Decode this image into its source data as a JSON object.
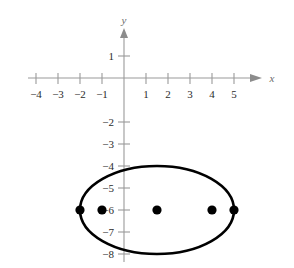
{
  "figure": {
    "title": "",
    "background_color": "#ffffff",
    "axis_color": "#8c8c8c",
    "curve_color": "#000000",
    "point_color": "#000000",
    "x_axis_label": "x",
    "y_axis_label": "y"
  },
  "chart_data": {
    "type": "scatter",
    "title": "",
    "xlabel": "x",
    "ylabel": "y",
    "grid": false,
    "legend": null,
    "xlim": [
      -4.6,
      5.8
    ],
    "ylim": [
      -8.6,
      1.8
    ],
    "x_ticks": [
      -4,
      -3,
      -2,
      -1,
      1,
      2,
      3,
      4,
      5
    ],
    "x_tick_labels": [
      "−4",
      "−3",
      "−2",
      "−1",
      "1",
      "2",
      "3",
      "4",
      "5"
    ],
    "y_ticks": [
      1,
      -2,
      -3,
      -4,
      -5,
      -6,
      -7,
      -8
    ],
    "y_tick_labels": [
      "1",
      "−2",
      "−3",
      "−4",
      "−5",
      "−6",
      "−7",
      "−8"
    ],
    "series": [
      {
        "name": "ellipse",
        "type": "ellipse",
        "center": [
          1.5,
          -6
        ],
        "semi_major_x": 3.5,
        "semi_minor_y": 2.0,
        "line_width": 2.6,
        "color": "#000000"
      },
      {
        "name": "marked-points",
        "type": "scatter",
        "marker": "filled-circle",
        "color": "#000000",
        "points": [
          {
            "x": -2,
            "y": -6,
            "role": "vertex"
          },
          {
            "x": -1,
            "y": -6,
            "role": "focus"
          },
          {
            "x": 1.5,
            "y": -6,
            "role": "center"
          },
          {
            "x": 4,
            "y": -6,
            "role": "focus"
          },
          {
            "x": 5,
            "y": -6,
            "role": "vertex"
          }
        ]
      }
    ]
  },
  "geometry": {
    "origin_px": {
      "x": 124,
      "y": 78
    },
    "unit_px": {
      "x": 22.0,
      "y": 22.0
    }
  }
}
